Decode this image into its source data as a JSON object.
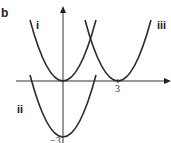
{
  "figure": {
    "panel_label": "b",
    "curve_labels": {
      "i": "i",
      "ii": "ii",
      "iii": "iii"
    },
    "x_tick_label": "3",
    "y_tick_label": "−3"
  },
  "colors": {
    "curve": "#2a2a2a",
    "axis": "#333333",
    "background": "#ffffff"
  },
  "curves": [
    {
      "id": "i",
      "equation": "y = x^2",
      "vertex": [
        0,
        0
      ]
    },
    {
      "id": "ii",
      "equation": "y = x^2 - 3",
      "vertex": [
        0,
        -3
      ]
    },
    {
      "id": "iii",
      "equation": "y = (x - 3)^2",
      "vertex": [
        3,
        0
      ]
    }
  ]
}
